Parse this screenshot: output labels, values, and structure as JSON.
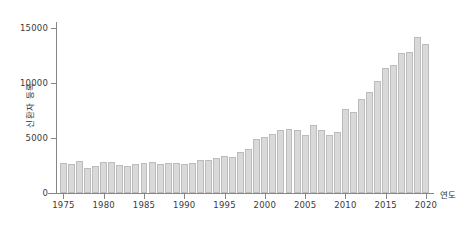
{
  "chart_data": {
    "type": "bar",
    "title": "",
    "subtitle": "",
    "xlabel": "연도",
    "ylabel": "신환자 등록",
    "xlim": [
      1974.2,
      2021.0
    ],
    "ylim": [
      0,
      15500
    ],
    "grid": false,
    "legend": null,
    "legend_position": "none",
    "yticks": [
      0,
      5000,
      10000,
      15000
    ],
    "ytick_labels": [
      "0",
      "5000",
      "10000",
      "15000"
    ],
    "xticks": [
      1975,
      1980,
      1985,
      1990,
      1995,
      2000,
      2005,
      2010,
      2015,
      2020
    ],
    "xtick_labels": [
      "1975",
      "1980",
      "1985",
      "1990",
      "1995",
      "2000",
      "2005",
      "2010",
      "2015",
      "2020"
    ],
    "bar_fill_color": "#d9d9d9",
    "bar_edge_color": "#bcbcbc",
    "axis_color": "#868686",
    "text_color": "#2e2e2e",
    "background_color": "#ffffff",
    "categories": [
      "1975",
      "1976",
      "1977",
      "1978",
      "1979",
      "1980",
      "1981",
      "1982",
      "1983",
      "1984",
      "1985",
      "1986",
      "1987",
      "1988",
      "1989",
      "1990",
      "1991",
      "1992",
      "1993",
      "1994",
      "1995",
      "1996",
      "1997",
      "1998",
      "1999",
      "2000",
      "2001",
      "2002",
      "2003",
      "2004",
      "2005",
      "2006",
      "2007",
      "2008",
      "2009",
      "2010",
      "2011",
      "2012",
      "2013",
      "2014",
      "2015",
      "2016",
      "2017",
      "2018",
      "2019",
      "2020"
    ],
    "values": [
      2750,
      2650,
      2950,
      2300,
      2500,
      2800,
      2800,
      2550,
      2500,
      2600,
      2750,
      2850,
      2600,
      2750,
      2750,
      2600,
      2750,
      3050,
      3050,
      3150,
      3350,
      3250,
      3750,
      4050,
      4900,
      5100,
      5350,
      5750,
      5800,
      5700,
      5250,
      6200,
      5700,
      5250,
      5550,
      7700,
      7400,
      8550,
      9200,
      10250,
      11400,
      11650,
      12750,
      12900,
      14200,
      13600
    ]
  }
}
